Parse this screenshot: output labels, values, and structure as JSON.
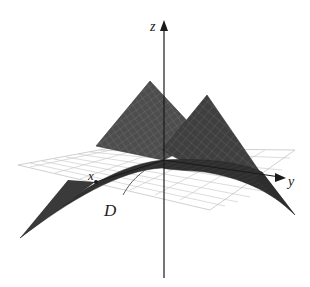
{
  "diagram": {
    "type": "3d-surface-over-domain",
    "axes": {
      "x_label": "x",
      "y_label": "y",
      "z_label": "z"
    },
    "region_label": "D",
    "colors": {
      "surface": "#4a4a4a",
      "surface_dark": "#2e2e2e",
      "surface_grid": "#6e6e6e",
      "plane_grid": "#b8b8b8",
      "axis": "#1a1a1a",
      "background": "#ffffff"
    }
  }
}
